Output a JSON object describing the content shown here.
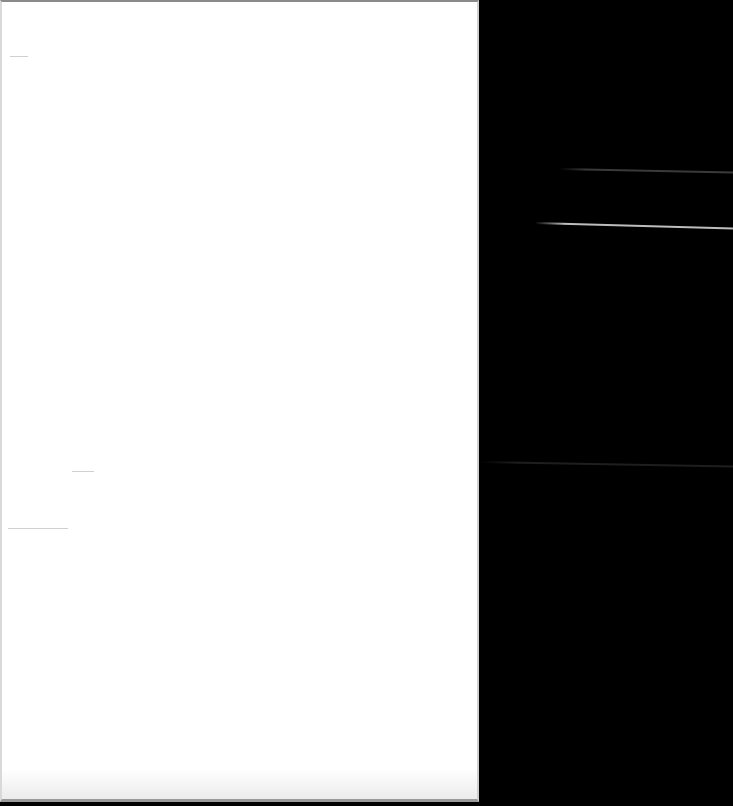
{
  "scene": {
    "description": "Blank white sheet of paper against a black background",
    "background_color": "#000000",
    "paper_color": "#ffffff"
  },
  "paper": {
    "text": "",
    "faint_marks": [
      {
        "x": 10,
        "y": 56,
        "w": 18
      },
      {
        "x": 72,
        "y": 471,
        "w": 22
      },
      {
        "x": 8,
        "y": 528,
        "w": 60
      }
    ]
  },
  "light_streaks": [
    {
      "x": 560,
      "y": 168,
      "w": 173,
      "angle": 1.2,
      "color": "#3a3a3a"
    },
    {
      "x": 535,
      "y": 222,
      "w": 198,
      "angle": 1.6,
      "color": "#bdbdbd"
    },
    {
      "x": 480,
      "y": 461,
      "w": 253,
      "angle": 1.0,
      "color": "#1e1e1e"
    }
  ]
}
